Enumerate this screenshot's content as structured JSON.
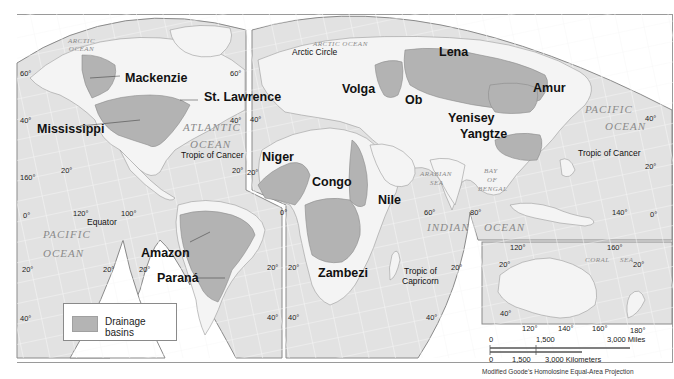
{
  "map": {
    "title_legend": "Drainage basins",
    "projection": "Modified Goode's Homolosine Equal-Area Projection",
    "colors": {
      "land": "#f4f4f4",
      "ocean": "#e2e2e2",
      "basin_fill": "#b3b3b3",
      "border": "#8a8a8a",
      "background": "#ffffff"
    },
    "basins": [
      {
        "name": "Mackenzie"
      },
      {
        "name": "St. Lawrence"
      },
      {
        "name": "Mississippi"
      },
      {
        "name": "Amazon"
      },
      {
        "name": "Paraná"
      },
      {
        "name": "Niger"
      },
      {
        "name": "Congo"
      },
      {
        "name": "Nile"
      },
      {
        "name": "Zambezi"
      },
      {
        "name": "Volga"
      },
      {
        "name": "Ob"
      },
      {
        "name": "Yenisey"
      },
      {
        "name": "Lena"
      },
      {
        "name": "Amur"
      },
      {
        "name": "Yangtze"
      }
    ],
    "oceans": {
      "arctic_nw": "ARCTIC\nOCEAN",
      "arctic_ne": "ARCTIC OCEAN",
      "atlantic_1": "ATLANTIC",
      "atlantic_2": "OCEAN",
      "pacific_w1": "PACIFIC",
      "pacific_w2": "OCEAN",
      "pacific_e1": "PACIFIC",
      "pacific_e2": "OCEAN",
      "indian_1": "INDIAN",
      "indian_2": "OCEAN",
      "arabian_1": "ARABIAN",
      "arabian_2": "SEA",
      "bengal_1": "BAY",
      "bengal_2": "OF",
      "bengal_3": "BENGAL",
      "coral_1": "CORAL",
      "coral_2": "SEA"
    },
    "lines": {
      "arctic_circle": "Arctic Circle",
      "tropic_cancer_w": "Tropic of Cancer",
      "tropic_cancer_e": "Tropic of Cancer",
      "equator": "Equator",
      "tropic_capricorn_1": "Tropic of",
      "tropic_capricorn_2": "Capricorn"
    },
    "coords": {
      "lat60_w": "60°",
      "lat60_e": "60°",
      "lat40_w": "40°",
      "lat40_e": "40°",
      "lat40_c": "40°",
      "lat40_pac": "40°",
      "lat20_w": "20°",
      "lat20_na": "20°",
      "lat20_eu": "20°",
      "lat20_pac": "20°",
      "lon160_hawaii": "160°",
      "lat0_w": "0°",
      "lon120": "120°",
      "lon100": "100°",
      "lat20_sw1": "20°",
      "lat20_sw2": "20°",
      "lat20_sw3": "20°",
      "lat40_sw": "40°",
      "lon0": "0°",
      "lat20_sa": "20°",
      "lat20_af": "20°",
      "lat40_sa": "40°",
      "lat40_af": "40°",
      "lon60": "60°",
      "lon80": "80°",
      "lat20_io": "20°",
      "lat40_io": "40°",
      "lon140": "140°",
      "lat0_e": "0°",
      "aus_lon120_t": "120°",
      "aus_lon160_t": "160°",
      "aus_lat20_w": "20°",
      "aus_lat20_e": "20°",
      "aus_lat40": "40°",
      "aus_lon120_b": "120°",
      "aus_lon140_b": "140°",
      "aus_lon160_b": "160°",
      "aus_lon180_b": "180°"
    },
    "scale": {
      "miles": {
        "zero": "0",
        "mid": "1,500",
        "end": "3,000 Miles"
      },
      "km": {
        "zero": "0",
        "mid": "1,500",
        "end": "3,000 Kilometers"
      }
    }
  }
}
